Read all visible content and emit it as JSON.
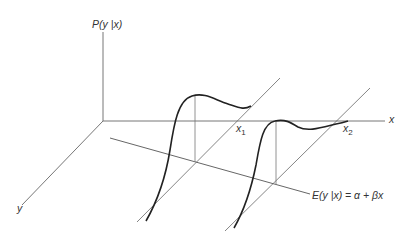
{
  "diagram": {
    "labels": {
      "p_axis": "P(y |x)",
      "x_axis": "x",
      "y_axis": "y",
      "x1": "x",
      "x1_sub": "1",
      "x2": "x",
      "x2_sub": "2",
      "regression": "E(y |x) = α +  βx"
    },
    "colors": {
      "axis": "#555555",
      "curve": "#222222",
      "label": "#333333"
    }
  }
}
